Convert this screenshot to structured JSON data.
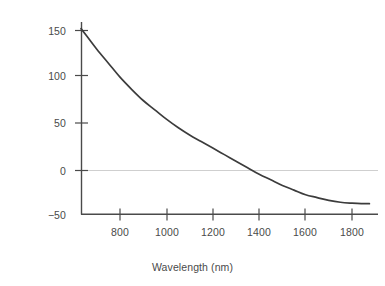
{
  "chart_data": {
    "type": "line",
    "title": "",
    "xlabel": "Wavelength (nm)",
    "ylabel": "Material dispersion [ps/(nm · km)]",
    "xlim": [
      632,
      1880
    ],
    "ylim": [
      -50,
      168
    ],
    "xticks": [
      800,
      1000,
      1200,
      1400,
      1600,
      1800
    ],
    "xtick_labels": [
      "800",
      "1000",
      "1200",
      "1400",
      "1600",
      "1800"
    ],
    "yticks": [
      -50,
      0,
      50,
      100,
      150
    ],
    "ytick_labels": [
      "−50",
      "0",
      "50",
      "100",
      "150"
    ],
    "grid": false,
    "legend": null,
    "zero_line": true,
    "series": [
      {
        "name": "Material dispersion",
        "color": "#3c3c3c",
        "x": [
          632,
          660,
          700,
          750,
          800,
          850,
          900,
          950,
          1000,
          1050,
          1100,
          1150,
          1200,
          1250,
          1300,
          1350,
          1400,
          1450,
          1500,
          1550,
          1600,
          1650,
          1700,
          1750,
          1800,
          1840,
          1875
        ],
        "y": [
          152,
          143,
          130,
          115,
          100,
          87,
          75,
          65,
          55,
          46,
          38,
          31,
          24,
          17,
          10,
          3,
          -4,
          -10,
          -16,
          -21,
          -26,
          -29,
          -32,
          -34,
          -35,
          -35.5,
          -35.5
        ]
      }
    ],
    "zero_crossing_nm": 1307,
    "axis_color": "#4a4a4a",
    "zero_line_color": "#cfcfcf",
    "background": "#ffffff"
  },
  "axes": {
    "y_title": "Material dispersion [ps/(nm · km)]",
    "x_title": "Wavelength (nm)",
    "y_labels": [
      "150",
      "100",
      "50",
      "0",
      "−50"
    ],
    "x_labels": [
      "800",
      "1000",
      "1200",
      "1400",
      "1600",
      "1800"
    ]
  }
}
